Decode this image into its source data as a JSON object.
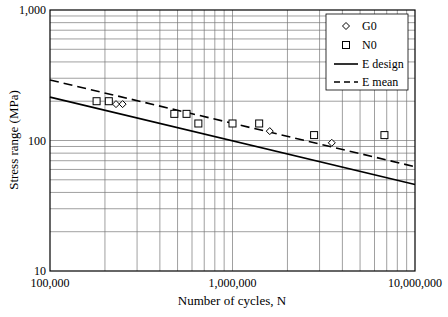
{
  "chart_data": {
    "type": "scatter",
    "title": "",
    "xlabel": "Number of cycles, N",
    "ylabel": "Stress range (MPa)",
    "xscale": "log",
    "yscale": "log",
    "xlim": [
      100000,
      10000000
    ],
    "ylim": [
      10,
      1000
    ],
    "xticks": [
      "100,000",
      "1,000,000",
      "10,000,000"
    ],
    "yticks": [
      "10",
      "100",
      "1,000"
    ],
    "grid": true,
    "legend_position": "upper right",
    "series": [
      {
        "name": "G0",
        "kind": "scatter",
        "marker": "diamond",
        "x": [
          230000,
          250000,
          1600000,
          3500000
        ],
        "y": [
          190,
          190,
          118,
          96
        ]
      },
      {
        "name": "N0",
        "kind": "scatter",
        "marker": "square",
        "x": [
          180000,
          210000,
          480000,
          560000,
          650000,
          1000000,
          1400000,
          2800000,
          6800000
        ],
        "y": [
          200,
          200,
          160,
          160,
          135,
          135,
          135,
          110,
          110
        ]
      },
      {
        "name": "E design",
        "kind": "line",
        "style": "solid",
        "x": [
          100000,
          10000000
        ],
        "y": [
          215,
          46
        ]
      },
      {
        "name": "E mean",
        "kind": "line",
        "style": "dashed",
        "x": [
          100000,
          10000000
        ],
        "y": [
          291,
          63
        ]
      }
    ]
  }
}
